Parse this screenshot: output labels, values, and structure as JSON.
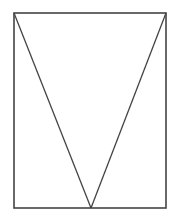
{
  "canvas": {
    "width": 180,
    "height": 223,
    "background": "#ffffff"
  },
  "stroke": {
    "color": "#444444",
    "width": 1.6
  },
  "rectangle": {
    "x": 14,
    "y": 13,
    "width": 152,
    "height": 195
  },
  "triangle": {
    "top_left": {
      "x": 14,
      "y": 13
    },
    "top_right": {
      "x": 166,
      "y": 13
    },
    "apex": {
      "x": 91,
      "y": 208
    }
  }
}
